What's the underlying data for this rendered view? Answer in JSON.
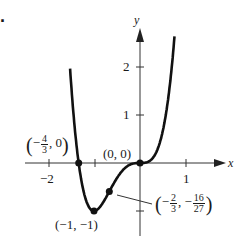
{
  "problem_number": ".",
  "chart_data": {
    "type": "line",
    "title": "",
    "function": "y = 3x^4 + 4x^3",
    "xlabel": "x",
    "ylabel": "y",
    "xlim": [
      -2.4,
      1.4
    ],
    "ylim": [
      -1.5,
      2.6
    ],
    "x_ticks": [
      {
        "value": -2,
        "label": "-2"
      },
      {
        "value": -1,
        "label": ""
      },
      {
        "value": 1,
        "label": "1"
      }
    ],
    "y_ticks": [
      {
        "value": 2,
        "label": "2"
      },
      {
        "value": 1,
        "label": "1"
      },
      {
        "value": -1,
        "label": ""
      }
    ],
    "grid": false,
    "points": [
      {
        "x": -1.3333,
        "y": 0,
        "label": "(-4/3, 0)"
      },
      {
        "x": 0,
        "y": 0,
        "label": "(0, 0)"
      },
      {
        "x": -1,
        "y": -1,
        "label": "(-1, -1)"
      },
      {
        "x": -0.6667,
        "y": -0.5926,
        "label": "(-2/3, -16/27)"
      }
    ]
  },
  "labels": {
    "x_axis": "x",
    "y_axis": "y",
    "tick_neg2": "−2",
    "tick_1": "1",
    "tick_y1": "1",
    "tick_y2": "2",
    "pt_origin": "(0, 0)",
    "pt_min": "(−1, −1)",
    "pt_zero_frac_num": "4",
    "pt_zero_frac_den": "3",
    "pt_zero_rest": ", 0",
    "pt_infl_x_num": "2",
    "pt_infl_x_den": "3",
    "pt_infl_y_num": "16",
    "pt_infl_y_den": "27"
  }
}
